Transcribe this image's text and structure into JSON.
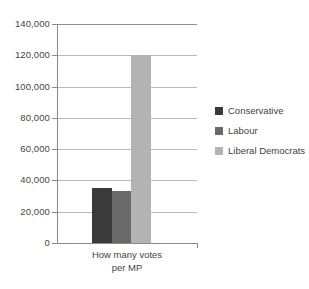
{
  "chart_data": {
    "type": "bar",
    "title": "",
    "subtitle": "",
    "xlabel": "How many votes per MP",
    "xlabel_lines": [
      "How many votes",
      "per MP"
    ],
    "ylabel": "",
    "categories": [
      "How many votes per MP"
    ],
    "ylim": [
      0,
      140000
    ],
    "ytick_values": [
      0,
      20000,
      40000,
      60000,
      80000,
      100000,
      120000,
      140000
    ],
    "ytick_labels": [
      "0",
      "20,000",
      "40,000",
      "60,000",
      "80,000",
      "100,000",
      "120,000",
      "140,000"
    ],
    "grid": true,
    "grid_axis": "y",
    "legend_position": "right",
    "series": [
      {
        "name": "Conservative",
        "values": [
          35000
        ],
        "color": "#3a3a3a"
      },
      {
        "name": "Labour",
        "values": [
          33000
        ],
        "color": "#696969"
      },
      {
        "name": "Liberal Democrats",
        "values": [
          120000
        ],
        "color": "#b3b3b3"
      }
    ]
  },
  "legend": {
    "items": [
      {
        "label": "Conservative",
        "color": "#3a3a3a"
      },
      {
        "label": "Labour",
        "color": "#696969"
      },
      {
        "label": "Liberal Democrats",
        "color": "#b3b3b3"
      }
    ]
  },
  "axes": {
    "x_caption_line1": "How many votes",
    "x_caption_line2": "per MP"
  }
}
